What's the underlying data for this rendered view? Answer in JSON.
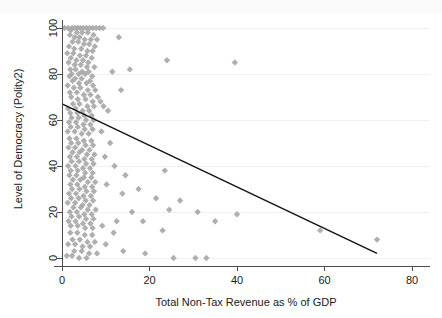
{
  "chart_data": {
    "type": "scatter",
    "title": "",
    "xlabel": "Total Non-Tax Revenue as % of GDP",
    "ylabel": "Level of Democracy (Polity2)",
    "xlim": [
      -2,
      82
    ],
    "ylim": [
      -4,
      104
    ],
    "xticks": [
      0,
      20,
      40,
      60,
      80
    ],
    "yticks": [
      0,
      20,
      40,
      60,
      80,
      100
    ],
    "xticklabels": [
      "0",
      "20",
      "40",
      "60",
      "80"
    ],
    "yticklabels": [
      "0",
      "20",
      "40",
      "60",
      "80",
      "100"
    ],
    "grid": "horizontal",
    "legend": "none",
    "marker": "diamond",
    "marker_color": "#a8a8a8",
    "fit_line_color": "#141414",
    "axis_color": "#4d4d4d",
    "gridline_color": "#f0f0f2",
    "background_color": "#ffffff",
    "series": [
      {
        "name": "Countries",
        "points": [
          [
            0.6,
            100
          ],
          [
            1.4,
            100
          ],
          [
            2.3,
            100
          ],
          [
            3.0,
            100
          ],
          [
            3.6,
            100
          ],
          [
            4.2,
            100
          ],
          [
            4.9,
            100
          ],
          [
            5.6,
            100
          ],
          [
            6.3,
            100
          ],
          [
            7.0,
            100
          ],
          [
            7.8,
            100
          ],
          [
            8.6,
            100
          ],
          [
            9.4,
            100
          ],
          [
            2.0,
            99
          ],
          [
            3.4,
            98
          ],
          [
            4.6,
            98
          ],
          [
            5.9,
            98
          ],
          [
            7.2,
            97
          ],
          [
            1.8,
            97
          ],
          [
            2.9,
            96
          ],
          [
            4.0,
            96
          ],
          [
            5.2,
            95
          ],
          [
            6.6,
            95
          ],
          [
            8.0,
            95
          ],
          [
            13.0,
            96
          ],
          [
            2.4,
            94
          ],
          [
            3.7,
            94
          ],
          [
            5.0,
            93
          ],
          [
            6.2,
            93
          ],
          [
            7.5,
            92
          ],
          [
            1.6,
            92
          ],
          [
            2.8,
            91
          ],
          [
            4.4,
            91
          ],
          [
            5.8,
            90
          ],
          [
            7.0,
            90
          ],
          [
            1.2,
            89
          ],
          [
            2.6,
            89
          ],
          [
            4.1,
            88
          ],
          [
            5.5,
            88
          ],
          [
            6.8,
            87
          ],
          [
            2.0,
            87
          ],
          [
            3.3,
            86
          ],
          [
            4.8,
            86
          ],
          [
            6.0,
            85
          ],
          [
            39.5,
            85
          ],
          [
            1.5,
            85
          ],
          [
            2.9,
            84
          ],
          [
            4.3,
            84
          ],
          [
            5.7,
            83
          ],
          [
            7.4,
            83
          ],
          [
            24.0,
            86
          ],
          [
            1.9,
            82
          ],
          [
            3.1,
            82
          ],
          [
            4.6,
            81
          ],
          [
            6.1,
            81
          ],
          [
            2.2,
            80
          ],
          [
            3.8,
            80
          ],
          [
            5.3,
            80
          ],
          [
            6.9,
            79
          ],
          [
            11.5,
            81
          ],
          [
            15.5,
            82
          ],
          [
            1.7,
            79
          ],
          [
            3.0,
            78
          ],
          [
            4.5,
            78
          ],
          [
            6.4,
            77
          ],
          [
            2.4,
            77
          ],
          [
            3.9,
            76
          ],
          [
            5.6,
            76
          ],
          [
            7.1,
            75
          ],
          [
            1.3,
            75
          ],
          [
            2.7,
            74
          ],
          [
            4.2,
            74
          ],
          [
            5.9,
            73
          ],
          [
            7.6,
            73
          ],
          [
            13.5,
            73
          ],
          [
            1.8,
            72
          ],
          [
            3.4,
            72
          ],
          [
            5.0,
            71
          ],
          [
            6.5,
            71
          ],
          [
            8.2,
            70
          ],
          [
            2.1,
            70
          ],
          [
            3.6,
            69
          ],
          [
            5.4,
            69
          ],
          [
            7.0,
            68
          ],
          [
            8.8,
            68
          ],
          [
            2.5,
            67
          ],
          [
            4.0,
            67
          ],
          [
            5.8,
            66
          ],
          [
            7.3,
            66
          ],
          [
            9.5,
            66
          ],
          [
            1.4,
            65
          ],
          [
            3.1,
            65
          ],
          [
            4.7,
            64
          ],
          [
            6.2,
            64
          ],
          [
            10.5,
            64
          ],
          [
            1.9,
            63
          ],
          [
            3.5,
            63
          ],
          [
            5.1,
            62
          ],
          [
            6.8,
            62
          ],
          [
            2.2,
            61
          ],
          [
            3.8,
            61
          ],
          [
            5.5,
            60
          ],
          [
            7.2,
            60
          ],
          [
            1.6,
            59
          ],
          [
            3.2,
            59
          ],
          [
            4.9,
            58
          ],
          [
            6.5,
            58
          ],
          [
            2.0,
            57
          ],
          [
            3.6,
            57
          ],
          [
            5.2,
            56
          ],
          [
            7.0,
            56
          ],
          [
            1.3,
            55
          ],
          [
            2.9,
            55
          ],
          [
            4.5,
            54
          ],
          [
            6.1,
            54
          ],
          [
            9.0,
            55
          ],
          [
            1.7,
            52
          ],
          [
            3.3,
            52
          ],
          [
            5.0,
            51
          ],
          [
            6.7,
            51
          ],
          [
            2.1,
            50
          ],
          [
            3.7,
            50
          ],
          [
            5.4,
            49
          ],
          [
            7.1,
            49
          ],
          [
            11.0,
            50
          ],
          [
            1.5,
            48
          ],
          [
            3.0,
            48
          ],
          [
            4.6,
            47
          ],
          [
            6.3,
            47
          ],
          [
            2.4,
            46
          ],
          [
            4.0,
            46
          ],
          [
            5.7,
            45
          ],
          [
            7.4,
            45
          ],
          [
            1.8,
            44
          ],
          [
            3.4,
            44
          ],
          [
            5.1,
            43
          ],
          [
            6.8,
            43
          ],
          [
            9.8,
            44
          ],
          [
            2.2,
            42
          ],
          [
            3.9,
            42
          ],
          [
            5.5,
            41
          ],
          [
            7.2,
            41
          ],
          [
            1.4,
            40
          ],
          [
            3.1,
            40
          ],
          [
            4.8,
            39
          ],
          [
            6.4,
            39
          ],
          [
            12.0,
            40
          ],
          [
            2.0,
            38
          ],
          [
            3.6,
            38
          ],
          [
            5.3,
            37
          ],
          [
            7.0,
            37
          ],
          [
            1.7,
            36
          ],
          [
            3.3,
            36
          ],
          [
            5.0,
            35
          ],
          [
            6.7,
            35
          ],
          [
            14.5,
            36
          ],
          [
            23.5,
            38
          ],
          [
            2.5,
            34
          ],
          [
            4.2,
            34
          ],
          [
            5.9,
            33
          ],
          [
            7.6,
            33
          ],
          [
            1.9,
            32
          ],
          [
            3.5,
            32
          ],
          [
            5.2,
            31
          ],
          [
            6.9,
            31
          ],
          [
            10.2,
            32
          ],
          [
            2.3,
            30
          ],
          [
            4.0,
            30
          ],
          [
            5.6,
            29
          ],
          [
            7.3,
            29
          ],
          [
            1.6,
            28
          ],
          [
            3.2,
            28
          ],
          [
            4.9,
            27
          ],
          [
            6.6,
            27
          ],
          [
            13.8,
            28
          ],
          [
            17.5,
            30
          ],
          [
            2.1,
            26
          ],
          [
            3.8,
            26
          ],
          [
            5.4,
            25
          ],
          [
            7.1,
            25
          ],
          [
            1.3,
            24
          ],
          [
            3.0,
            24
          ],
          [
            4.7,
            23
          ],
          [
            6.3,
            23
          ],
          [
            21.5,
            26
          ],
          [
            27.0,
            25
          ],
          [
            2.6,
            22
          ],
          [
            4.3,
            22
          ],
          [
            5.9,
            21
          ],
          [
            7.7,
            21
          ],
          [
            1.8,
            20
          ],
          [
            3.4,
            20
          ],
          [
            5.1,
            19
          ],
          [
            6.8,
            19
          ],
          [
            16.0,
            20
          ],
          [
            24.5,
            21
          ],
          [
            31.0,
            20
          ],
          [
            40.0,
            19
          ],
          [
            2.2,
            18
          ],
          [
            3.9,
            18
          ],
          [
            5.5,
            17
          ],
          [
            7.2,
            17
          ],
          [
            1.5,
            16
          ],
          [
            3.1,
            16
          ],
          [
            4.8,
            15
          ],
          [
            6.5,
            15
          ],
          [
            12.5,
            16
          ],
          [
            18.5,
            16
          ],
          [
            35.0,
            16
          ],
          [
            59.0,
            12
          ],
          [
            2.0,
            14
          ],
          [
            3.6,
            14
          ],
          [
            5.3,
            13
          ],
          [
            7.0,
            13
          ],
          [
            9.2,
            14
          ],
          [
            1.9,
            11
          ],
          [
            3.5,
            11
          ],
          [
            5.2,
            10
          ],
          [
            6.9,
            10
          ],
          [
            11.8,
            11
          ],
          [
            23.0,
            12
          ],
          [
            2.4,
            8
          ],
          [
            4.1,
            8
          ],
          [
            5.8,
            7
          ],
          [
            7.5,
            7
          ],
          [
            1.4,
            6
          ],
          [
            3.0,
            6
          ],
          [
            4.7,
            5
          ],
          [
            6.4,
            5
          ],
          [
            10.0,
            6
          ],
          [
            2.8,
            3
          ],
          [
            4.5,
            3
          ],
          [
            6.2,
            2
          ],
          [
            8.0,
            2
          ],
          [
            14.0,
            3
          ],
          [
            19.0,
            2
          ],
          [
            25.5,
            0
          ],
          [
            30.5,
            0
          ],
          [
            33.0,
            0
          ],
          [
            72.0,
            8
          ],
          [
            1.1,
            1
          ],
          [
            2.3,
            1
          ],
          [
            3.9,
            0
          ],
          [
            5.6,
            0
          ]
        ]
      }
    ],
    "fit_line": {
      "x_start": 0,
      "y_start": 67,
      "x_end": 72,
      "y_end": 2,
      "description": "negative linear fit"
    }
  }
}
